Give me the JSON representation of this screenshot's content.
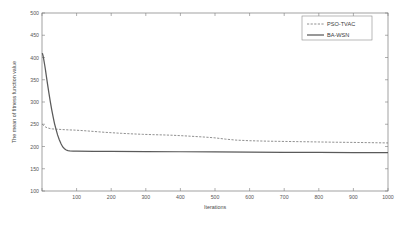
{
  "chart_data": {
    "type": "line",
    "title": "",
    "xlabel": "Iterations",
    "ylabel": "The mean of fitness function value",
    "xlim": [
      0,
      1000
    ],
    "ylim": [
      100,
      500
    ],
    "grid": false,
    "legend_position": "top-right",
    "xticks": [
      0,
      100,
      200,
      300,
      400,
      500,
      600,
      700,
      800,
      900,
      1000
    ],
    "xtick_labels": [
      "",
      "100",
      "200",
      "300",
      "400",
      "500",
      "600",
      "700",
      "800",
      "900",
      "1000"
    ],
    "yticks": [
      100,
      150,
      200,
      250,
      300,
      350,
      400,
      450,
      500
    ],
    "ytick_labels": [
      "100",
      "150",
      "200",
      "250",
      "300",
      "350",
      "400",
      "450",
      "500"
    ],
    "series": [
      {
        "name": "PSO-TVAC",
        "style": "dashed",
        "color": "#6b6b6b",
        "x": [
          1,
          5,
          10,
          15,
          20,
          25,
          30,
          40,
          50,
          60,
          70,
          80,
          90,
          100,
          120,
          140,
          160,
          180,
          200,
          230,
          260,
          290,
          320,
          350,
          380,
          410,
          440,
          470,
          500,
          530,
          560,
          600,
          650,
          700,
          750,
          800,
          850,
          900,
          950,
          1000
        ],
        "y": [
          250,
          247,
          244,
          242,
          241,
          240,
          239.5,
          239,
          238.5,
          238,
          237.6,
          237.2,
          237,
          236.6,
          235.6,
          234.4,
          233.2,
          232,
          231,
          229.6,
          228.4,
          227.4,
          226.6,
          226,
          225.2,
          224,
          222.6,
          221.2,
          219.4,
          216.6,
          214.4,
          213,
          212,
          211.4,
          210.8,
          210.2,
          209.6,
          209.2,
          208.6,
          208
        ]
      },
      {
        "name": "BA-WSN",
        "style": "solid",
        "color": "#5a5a5a",
        "x": [
          1,
          3,
          5,
          8,
          10,
          13,
          16,
          20,
          24,
          28,
          32,
          36,
          40,
          45,
          50,
          55,
          60,
          65,
          70,
          75,
          80,
          90,
          100,
          150,
          200,
          300,
          400,
          500,
          600,
          700,
          800,
          900,
          1000
        ],
        "y": [
          410,
          404,
          396,
          382,
          372,
          356,
          340,
          320,
          301,
          283,
          267,
          252,
          240,
          226,
          215,
          206,
          199,
          195,
          192,
          190.6,
          190,
          189.6,
          189.4,
          189.2,
          189,
          188.6,
          188.2,
          187.8,
          187.4,
          187,
          186.6,
          186.2,
          186
        ]
      }
    ],
    "legend": [
      {
        "label": "PSO-TVAC",
        "style": "dashed"
      },
      {
        "label": "BA-WSN",
        "style": "solid"
      }
    ]
  }
}
